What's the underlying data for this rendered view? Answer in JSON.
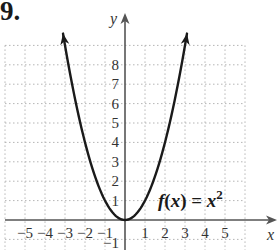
{
  "problem": {
    "number": "9."
  },
  "chart_data": {
    "type": "line",
    "title": "",
    "function_label": "f(x) = x²",
    "function_label_parts": {
      "f": "f",
      "open": "(",
      "x": "x",
      "close_eq": ") = ",
      "x2": "x",
      "exp": "2"
    },
    "xlabel": "x",
    "ylabel": "y",
    "x_tick_labels": [
      "−5",
      "−4",
      "−3",
      "−2",
      "−1",
      "1",
      "2",
      "3",
      "4",
      "5"
    ],
    "x_ticks": [
      -5,
      -4,
      -3,
      -2,
      -1,
      1,
      2,
      3,
      4,
      5
    ],
    "y_tick_labels": [
      "−1",
      "1",
      "2",
      "3",
      "4",
      "5",
      "6",
      "7",
      "8"
    ],
    "y_ticks": [
      -1,
      1,
      2,
      3,
      4,
      5,
      6,
      7,
      8
    ],
    "xlim": [
      -6,
      7.6
    ],
    "ylim": [
      -1.3,
      10.4
    ],
    "grid": true,
    "grid_style": "dotted",
    "series": [
      {
        "name": "f(x) = x^2",
        "x": [
          -3.1,
          -3,
          -2,
          -1,
          0,
          1,
          2,
          3,
          3.1
        ],
        "y": [
          9.61,
          9,
          4,
          1,
          0,
          1,
          4,
          9,
          9.61
        ],
        "arrows_at_ends": true
      }
    ],
    "colors": {
      "curve": "#1a1a1a",
      "axis": "#555555",
      "grid": "#b5b5b5"
    }
  }
}
